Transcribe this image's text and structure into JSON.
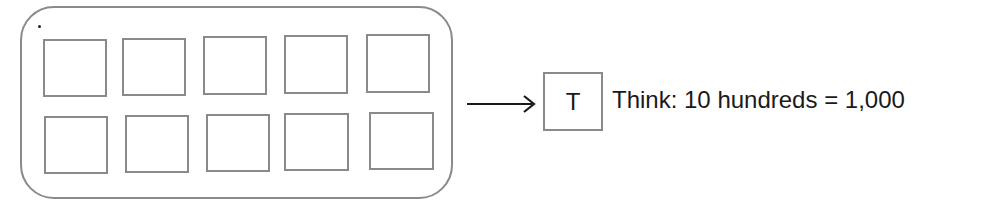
{
  "diagram": {
    "group": {
      "label": "ten hundreds blocks",
      "rows": 2,
      "columns": 5,
      "squares": [
        {
          "x": 43,
          "y": 39,
          "w": 64,
          "h": 58
        },
        {
          "x": 122,
          "y": 38,
          "w": 64,
          "h": 58
        },
        {
          "x": 203,
          "y": 36,
          "w": 64,
          "h": 59
        },
        {
          "x": 284,
          "y": 35,
          "w": 64,
          "h": 59
        },
        {
          "x": 366,
          "y": 34,
          "w": 64,
          "h": 59
        },
        {
          "x": 44,
          "y": 116,
          "w": 64,
          "h": 58
        },
        {
          "x": 125,
          "y": 115,
          "w": 64,
          "h": 58
        },
        {
          "x": 206,
          "y": 114,
          "w": 64,
          "h": 58
        },
        {
          "x": 284,
          "y": 113,
          "w": 65,
          "h": 58
        },
        {
          "x": 369,
          "y": 112,
          "w": 65,
          "h": 58
        }
      ]
    },
    "arrow": "right-arrow",
    "result_box_label": "T",
    "think_text": "Think: 10 hundreds = 1,000",
    "colors": {
      "stroke": "#8a8a8a",
      "text": "#1a1a1a"
    }
  }
}
